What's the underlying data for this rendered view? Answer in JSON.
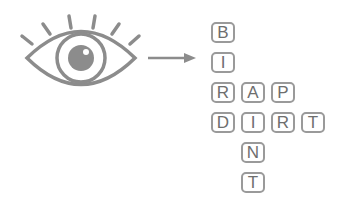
{
  "diagram": {
    "colors": {
      "icon": "#8c8c8c",
      "tile_border": "#9a9a9a",
      "letter": "#6e6e6e"
    },
    "icons": [
      "eye-icon",
      "arrow-right-icon"
    ],
    "tiles": [
      {
        "letter": "B",
        "col": 0,
        "row": 0
      },
      {
        "letter": "I",
        "col": 0,
        "row": 1
      },
      {
        "letter": "R",
        "col": 0,
        "row": 2
      },
      {
        "letter": "A",
        "col": 1,
        "row": 2
      },
      {
        "letter": "P",
        "col": 2,
        "row": 2
      },
      {
        "letter": "D",
        "col": 0,
        "row": 3
      },
      {
        "letter": "I",
        "col": 1,
        "row": 3
      },
      {
        "letter": "R",
        "col": 2,
        "row": 3
      },
      {
        "letter": "T",
        "col": 3,
        "row": 3
      },
      {
        "letter": "N",
        "col": 1,
        "row": 4
      },
      {
        "letter": "T",
        "col": 1,
        "row": 5
      }
    ],
    "words": {
      "vertical_1": "BIRD",
      "horizontal_1": "RAP",
      "horizontal_2": "DIRT",
      "vertical_2": "AINT"
    }
  }
}
